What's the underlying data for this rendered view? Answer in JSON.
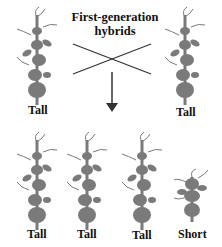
{
  "title": {
    "line1": "First-generation",
    "line2": "hybrids"
  },
  "parents": [
    {
      "label": "Tall"
    },
    {
      "label": "Tall"
    }
  ],
  "offspring": [
    {
      "label": "Tall"
    },
    {
      "label": "Tall"
    },
    {
      "label": "Tall"
    },
    {
      "label": "Short"
    }
  ],
  "colors": {
    "plant": "#7a7a7a",
    "text": "#111111",
    "line": "#333333"
  }
}
